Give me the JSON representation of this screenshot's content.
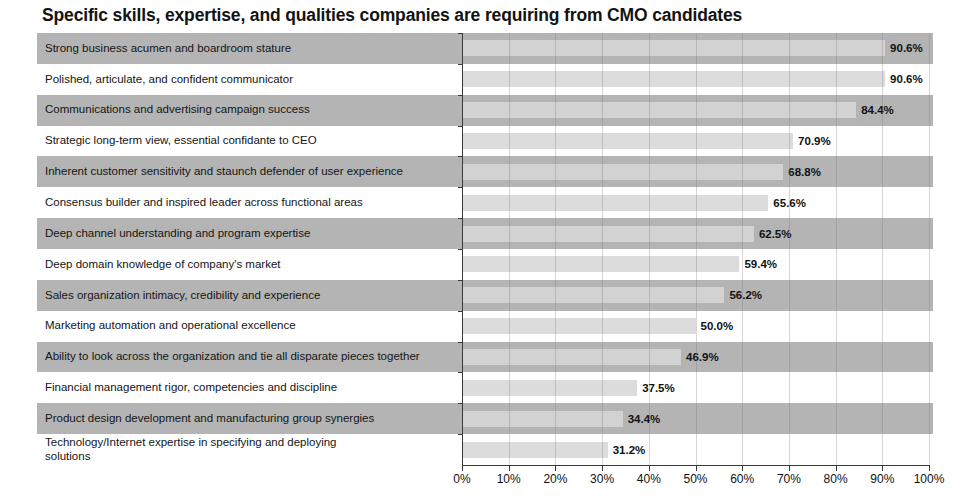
{
  "chart": {
    "title": "Specific skills, expertise, and qualities companies are requiring from CMO candidates"
  },
  "chart_data": {
    "type": "bar",
    "orientation": "horizontal",
    "title": "Specific skills, expertise, and qualities companies are requiring from CMO candidates",
    "xlabel": "",
    "ylabel": "",
    "xlim": [
      0,
      100
    ],
    "grid": true,
    "legend": "none",
    "value_format": "percent_one_decimal",
    "bar_color": "#dcdcdc",
    "band_color": "#b4b4b4",
    "axis_color": "#3a3a3a",
    "categories": [
      "Strong business acumen and boardroom stature",
      "Polished, articulate, and confident communicator",
      "Communications and advertising campaign success",
      "Strategic long-term view, essential confidante to CEO",
      "Inherent customer sensitivity and staunch defender of user experience",
      "Consensus builder and inspired leader across functional areas",
      "Deep channel understanding and program expertise",
      "Deep domain knowledge of company's market",
      "Sales organization intimacy, credibility and experience",
      "Marketing automation and operational excellence",
      "Ability to look across the organization and tie all disparate pieces together",
      "Financial management rigor, competencies and discipline",
      "Product design development and manufacturing group synergies",
      "Technology/Internet expertise in specifying and deploying\nsolutions"
    ],
    "values": [
      90.6,
      90.6,
      84.4,
      70.9,
      68.8,
      65.6,
      62.5,
      59.4,
      56.2,
      50.0,
      46.9,
      37.5,
      34.4,
      31.2
    ],
    "value_labels": [
      "90.6%",
      "90.6%",
      "84.4%",
      "70.9%",
      "68.8%",
      "65.6%",
      "62.5%",
      "59.4%",
      "56.2%",
      "50.0%",
      "46.9%",
      "37.5%",
      "34.4%",
      "31.2%"
    ],
    "xticks": [
      0,
      10,
      20,
      30,
      40,
      50,
      60,
      70,
      80,
      90,
      100
    ],
    "xtick_labels": [
      "0%",
      "10%",
      "20%",
      "30%",
      "40%",
      "50%",
      "60%",
      "70%",
      "80%",
      "90%",
      "100%"
    ]
  }
}
